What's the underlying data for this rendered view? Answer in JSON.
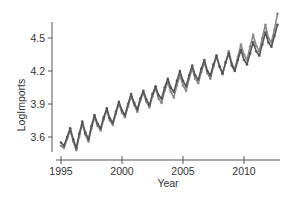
{
  "chart_data": {
    "type": "line",
    "title": "",
    "xlabel": "Year",
    "ylabel": "LogImports",
    "xlim": [
      1994.6,
      2013.2
    ],
    "ylim": [
      3.48,
      4.74
    ],
    "xticks": [
      1995,
      2000,
      2005,
      2010
    ],
    "xtick_labels": [
      "1995",
      "2000",
      "2005",
      "2010"
    ],
    "yticks": [
      3.6,
      3.9,
      4.2,
      4.5
    ],
    "ytick_labels": [
      "3.6",
      "3.9",
      "4.2",
      "4.5"
    ],
    "grid": false,
    "legend": null,
    "series": [
      {
        "name": "Series 1 (dark)",
        "color": "#555555",
        "x": [
          1995.0,
          1995.25,
          1995.5,
          1995.75,
          1996.0,
          1996.25,
          1996.5,
          1996.75,
          1997.0,
          1997.25,
          1997.5,
          1997.75,
          1998.0,
          1998.25,
          1998.5,
          1998.75,
          1999.0,
          1999.25,
          1999.5,
          1999.75,
          2000.0,
          2000.25,
          2000.5,
          2000.75,
          2001.0,
          2001.25,
          2001.5,
          2001.75,
          2002.0,
          2002.25,
          2002.5,
          2002.75,
          2003.0,
          2003.25,
          2003.5,
          2003.75,
          2004.0,
          2004.25,
          2004.5,
          2004.75,
          2005.0,
          2005.25,
          2005.5,
          2005.75,
          2006.0,
          2006.25,
          2006.5,
          2006.75,
          2007.0,
          2007.25,
          2007.5,
          2007.75,
          2008.0,
          2008.25,
          2008.5,
          2008.75,
          2009.0,
          2009.25,
          2009.5,
          2009.75,
          2010.0,
          2010.25,
          2010.5,
          2010.75,
          2011.0,
          2011.25,
          2011.5,
          2011.75,
          2012.0,
          2012.25,
          2012.5,
          2012.75
        ],
        "values": [
          3.55,
          3.52,
          3.6,
          3.68,
          3.58,
          3.5,
          3.63,
          3.74,
          3.64,
          3.58,
          3.7,
          3.8,
          3.72,
          3.68,
          3.78,
          3.86,
          3.77,
          3.73,
          3.83,
          3.92,
          3.84,
          3.8,
          3.9,
          3.99,
          3.91,
          3.85,
          3.95,
          4.02,
          3.94,
          3.89,
          3.99,
          4.06,
          3.98,
          3.95,
          4.05,
          4.13,
          4.05,
          4.01,
          4.11,
          4.2,
          4.11,
          4.06,
          4.16,
          4.25,
          4.16,
          4.12,
          4.22,
          4.3,
          4.2,
          4.16,
          4.26,
          4.34,
          4.24,
          4.18,
          4.28,
          4.36,
          4.25,
          4.2,
          4.3,
          4.39,
          4.3,
          4.26,
          4.36,
          4.46,
          4.38,
          4.34,
          4.44,
          4.55,
          4.46,
          4.42,
          4.52,
          4.62
        ]
      },
      {
        "name": "Series 2 (light)",
        "color": "#8a8a8a",
        "x": [
          1995.0,
          1995.25,
          1995.5,
          1995.75,
          1996.0,
          1996.25,
          1996.5,
          1996.75,
          1997.0,
          1997.25,
          1997.5,
          1997.75,
          1998.0,
          1998.25,
          1998.5,
          1998.75,
          1999.0,
          1999.25,
          1999.5,
          1999.75,
          2000.0,
          2000.25,
          2000.5,
          2000.75,
          2001.0,
          2001.25,
          2001.5,
          2001.75,
          2002.0,
          2002.25,
          2002.5,
          2002.75,
          2003.0,
          2003.25,
          2003.5,
          2003.75,
          2004.0,
          2004.25,
          2004.5,
          2004.75,
          2005.0,
          2005.25,
          2005.5,
          2005.75,
          2006.0,
          2006.25,
          2006.5,
          2006.75,
          2007.0,
          2007.25,
          2007.5,
          2007.75,
          2008.0,
          2008.25,
          2008.5,
          2008.75,
          2009.0,
          2009.25,
          2009.5,
          2009.75,
          2010.0,
          2010.25,
          2010.5,
          2010.75,
          2011.0,
          2011.25,
          2011.5,
          2011.75,
          2012.0,
          2012.25,
          2012.5,
          2012.75
        ],
        "values": [
          3.52,
          3.5,
          3.58,
          3.66,
          3.56,
          3.48,
          3.61,
          3.72,
          3.62,
          3.56,
          3.68,
          3.78,
          3.7,
          3.66,
          3.76,
          3.84,
          3.75,
          3.71,
          3.81,
          3.9,
          3.82,
          3.78,
          3.88,
          3.97,
          3.89,
          3.83,
          3.93,
          4.0,
          3.92,
          3.87,
          3.97,
          4.04,
          3.95,
          3.91,
          4.02,
          4.1,
          4.01,
          3.96,
          4.07,
          4.16,
          4.07,
          4.02,
          4.13,
          4.22,
          4.13,
          4.09,
          4.19,
          4.28,
          4.18,
          4.13,
          4.24,
          4.33,
          4.24,
          4.17,
          4.28,
          4.38,
          4.27,
          4.22,
          4.33,
          4.44,
          4.35,
          4.3,
          4.42,
          4.53,
          4.43,
          4.38,
          4.5,
          4.62,
          4.5,
          4.46,
          4.58,
          4.72
        ]
      }
    ]
  }
}
